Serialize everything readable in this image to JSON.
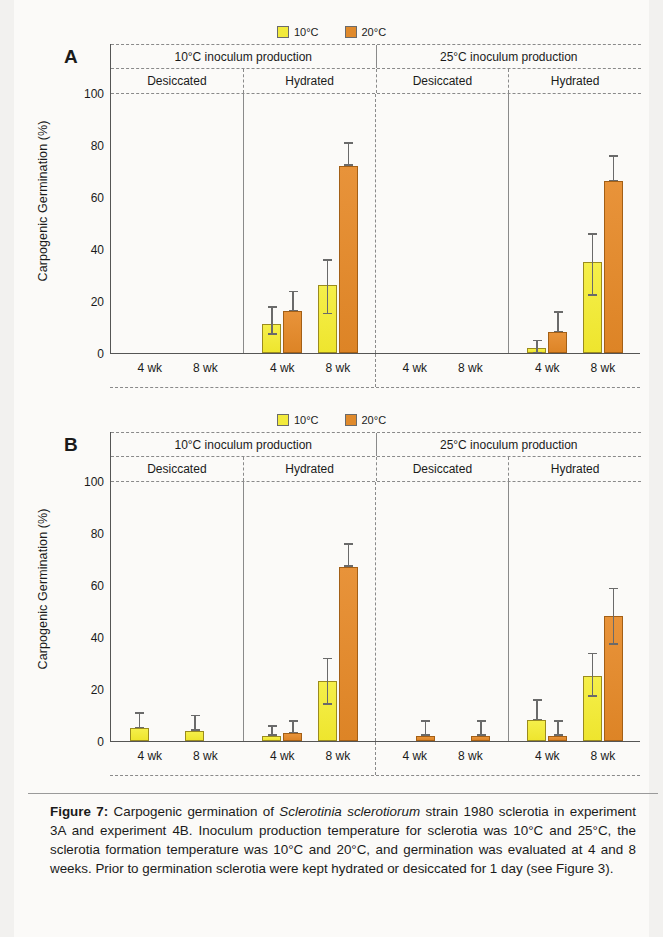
{
  "legend": {
    "items": [
      {
        "label": "10°C",
        "color": "#f2ea3c",
        "name": "legend-10c"
      },
      {
        "label": "20°C",
        "color": "#e08a2c",
        "name": "legend-20c"
      }
    ]
  },
  "axis": {
    "ylabel": "Carpogenic Germination (%)",
    "yticks": [
      "100",
      "80",
      "60",
      "40",
      "20",
      "0"
    ],
    "ymin": 0,
    "ymax": 100,
    "xticks": [
      "4 wk",
      "8 wk",
      "4 wk",
      "8 wk",
      "4 wk",
      "8 wk",
      "4 wk",
      "8 wk"
    ]
  },
  "headers": {
    "row1": [
      "10°C inoculum production",
      "25°C inoculum production"
    ],
    "row2": [
      "Desiccated",
      "Hydrated",
      "Desiccated",
      "Hydrated"
    ]
  },
  "panels": [
    {
      "letter": "A"
    },
    {
      "letter": "B"
    }
  ],
  "caption": {
    "label": "Figure 7:",
    "text1": " Carpogenic germination of ",
    "species": "Sclerotinia sclerotiorum",
    "text2": " strain 1980 sclerotia in experiment 3A and experiment 4B. Inoculum production temperature for sclerotia was 10°C and 25°C, the sclerotia formation temperature was 10°C and 20°C, and germination was evaluated at 4 and 8 weeks. Prior to germination sclerotia were kept hydrated or desiccated for 1 day (see Figure 3)."
  },
  "chart_data": [
    {
      "type": "bar",
      "title": "A",
      "xlabel": "",
      "ylabel": "Carpogenic Germination (%)",
      "ylim": [
        0,
        100
      ],
      "grid": false,
      "legend_position": "top-center",
      "group_headers_level1": [
        "10°C inoculum production",
        "25°C inoculum production"
      ],
      "group_headers_level2": [
        "Desiccated",
        "Hydrated",
        "Desiccated",
        "Hydrated"
      ],
      "categories": [
        "10C-Desiccated-4wk",
        "10C-Desiccated-8wk",
        "10C-Hydrated-4wk",
        "10C-Hydrated-8wk",
        "25C-Desiccated-4wk",
        "25C-Desiccated-8wk",
        "25C-Hydrated-4wk",
        "25C-Hydrated-8wk"
      ],
      "category_labels": [
        "4 wk",
        "8 wk",
        "4 wk",
        "8 wk",
        "4 wk",
        "8 wk",
        "4 wk",
        "8 wk"
      ],
      "series": [
        {
          "name": "10°C",
          "color": "#f2ea3c",
          "values": [
            0,
            0,
            11,
            26,
            0,
            0,
            2,
            35
          ],
          "err_low": [
            0,
            0,
            4,
            11,
            0,
            0,
            2,
            13
          ],
          "err_high": [
            0,
            0,
            7,
            10,
            0,
            0,
            3,
            11
          ]
        },
        {
          "name": "20°C",
          "color": "#e08a2c",
          "values": [
            0,
            0,
            16,
            72,
            0,
            0,
            8,
            66
          ],
          "err_low": [
            0,
            0,
            0,
            0,
            0,
            0,
            0,
            0
          ],
          "err_high": [
            0,
            0,
            8,
            9,
            0,
            0,
            8,
            10
          ]
        }
      ]
    },
    {
      "type": "bar",
      "title": "B",
      "xlabel": "",
      "ylabel": "Carpogenic Germination (%)",
      "ylim": [
        0,
        100
      ],
      "grid": false,
      "legend_position": "top-center",
      "group_headers_level1": [
        "10°C inoculum production",
        "25°C inoculum production"
      ],
      "group_headers_level2": [
        "Desiccated",
        "Hydrated",
        "Desiccated",
        "Hydrated"
      ],
      "categories": [
        "10C-Desiccated-4wk",
        "10C-Desiccated-8wk",
        "10C-Hydrated-4wk",
        "10C-Hydrated-8wk",
        "25C-Desiccated-4wk",
        "25C-Desiccated-8wk",
        "25C-Hydrated-4wk",
        "25C-Hydrated-8wk"
      ],
      "category_labels": [
        "4 wk",
        "8 wk",
        "4 wk",
        "8 wk",
        "4 wk",
        "8 wk",
        "4 wk",
        "8 wk"
      ],
      "series": [
        {
          "name": "10°C",
          "color": "#f2ea3c",
          "values": [
            5,
            4,
            2,
            23,
            0,
            0,
            8,
            25
          ],
          "err_low": [
            0,
            0,
            0,
            9,
            0,
            0,
            0,
            8
          ],
          "err_high": [
            6,
            6,
            4,
            9,
            0,
            0,
            8,
            9
          ]
        },
        {
          "name": "20°C",
          "color": "#e08a2c",
          "values": [
            0,
            0,
            3,
            67,
            2,
            2,
            2,
            48
          ],
          "err_low": [
            0,
            0,
            0,
            0,
            0,
            0,
            0,
            11
          ],
          "err_high": [
            0,
            0,
            5,
            9,
            6,
            6,
            6,
            11
          ]
        }
      ]
    }
  ]
}
